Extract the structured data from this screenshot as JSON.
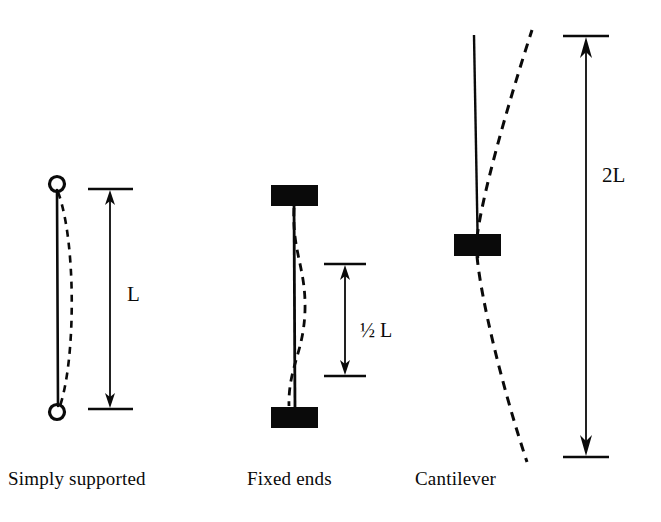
{
  "figure": {
    "type": "engineering-diagram",
    "background_color": "#ffffff",
    "ink_color": "#0a0a0a",
    "cases": [
      {
        "id": "simply-supported",
        "caption": "Simply supported",
        "end_condition": "pinned-pinned",
        "support_icon": "pin-circle",
        "effective_length_label": "L",
        "effective_length_factor": 1.0,
        "buckled_shape": "single half-sine bowing right",
        "column_top_y": 184,
        "column_bottom_y": 412,
        "column_x": 57,
        "dimension_x": 110,
        "dimension_top_y": 190,
        "dimension_bottom_y": 408
      },
      {
        "id": "fixed-ends",
        "caption": "Fixed ends",
        "end_condition": "fixed-fixed",
        "support_icon": "fixed-block",
        "effective_length_label": "½ L",
        "effective_length_factor": 0.5,
        "buckled_shape": "S-curve with two inflection points",
        "column_top_y": 206,
        "column_bottom_y": 407,
        "column_x": 295,
        "dimension_x": 345,
        "dimension_top_y": 265,
        "dimension_bottom_y": 375
      },
      {
        "id": "cantilever",
        "caption": "Cantilever",
        "end_condition": "fixed-free",
        "support_icon": "fixed-block",
        "effective_length_label": "2L",
        "effective_length_factor": 2.0,
        "buckled_shape": "quarter-sine sweeping right about fixed base",
        "column_top_y": 35,
        "column_bottom_y": 258,
        "column_x": 477,
        "dimension_x": 586,
        "dimension_top_y": 37,
        "dimension_bottom_y": 456
      }
    ],
    "labels": {
      "simply_supported": "Simply supported",
      "fixed_ends": "Fixed ends",
      "cantilever": "Cantilever",
      "length_L": "L",
      "length_half_L": "½ L",
      "length_2L": "2L"
    }
  }
}
